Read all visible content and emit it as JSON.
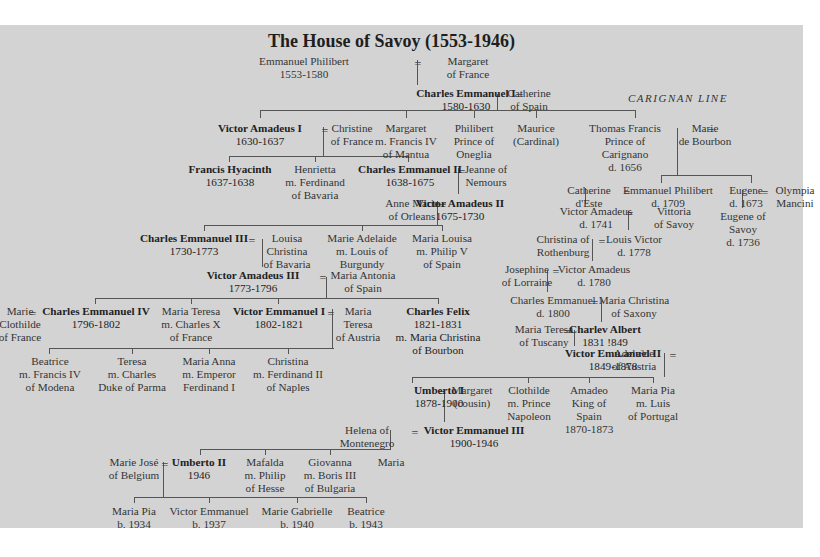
{
  "title": "The House of Savoy (1553-1946)",
  "carignan_label": "CARIGNAN LINE",
  "colors": {
    "panel": "#d3d3d3",
    "text": "#2a2a2a",
    "lines": "#555555",
    "page": "#ffffff"
  },
  "nodes": [
    {
      "id": "emmanuel-philibert",
      "x": 304,
      "y": 55,
      "bold": false,
      "lines": [
        "Emmanuel Philibert",
        "1553-1580"
      ]
    },
    {
      "id": "margaret-of-france",
      "x": 468,
      "y": 55,
      "bold": false,
      "lines": [
        "Margaret",
        "of France"
      ]
    },
    {
      "id": "charles-emmanuel-i",
      "x": 466,
      "y": 87,
      "bold": true,
      "lines": [
        "Charles Emmanuel I",
        "1580-1630"
      ],
      "sub": true
    },
    {
      "id": "catherine-of-spain",
      "x": 529,
      "y": 87,
      "bold": false,
      "lines": [
        "Catherine",
        "of Spain"
      ]
    },
    {
      "id": "victor-amadeus-i",
      "x": 260,
      "y": 122,
      "bold": true,
      "lines": [
        "Victor Amadeus I",
        "1630-1637"
      ]
    },
    {
      "id": "christine-of-france",
      "x": 352,
      "y": 122,
      "bold": false,
      "lines": [
        "Christine",
        "of France"
      ]
    },
    {
      "id": "margaret-mantua",
      "x": 406,
      "y": 122,
      "bold": false,
      "lines": [
        "Margaret",
        "m. Francis IV",
        "of Mantua"
      ]
    },
    {
      "id": "philibert-oneglia",
      "x": 474,
      "y": 122,
      "bold": false,
      "lines": [
        "Philibert",
        "Prince of",
        "Oneglia"
      ]
    },
    {
      "id": "maurice-cardinal",
      "x": 536,
      "y": 122,
      "bold": false,
      "lines": [
        "Maurice",
        "(Cardinal)"
      ]
    },
    {
      "id": "thomas-francis",
      "x": 625,
      "y": 122,
      "bold": false,
      "lines": [
        "Thomas Francis",
        "Prince of",
        "Carignano",
        "d. 1656"
      ]
    },
    {
      "id": "marie-de-bourbon",
      "x": 705,
      "y": 122,
      "bold": false,
      "lines": [
        "Marie",
        "de Bourbon"
      ]
    },
    {
      "id": "francis-hyacinth",
      "x": 230,
      "y": 163,
      "bold": true,
      "lines": [
        "Francis Hyacinth",
        "1637-1638"
      ]
    },
    {
      "id": "henrietta",
      "x": 315,
      "y": 163,
      "bold": false,
      "lines": [
        "Henrietta",
        "m. Ferdinand",
        "of Bavaria"
      ]
    },
    {
      "id": "charles-emmanuel-ii",
      "x": 410,
      "y": 163,
      "bold": true,
      "lines": [
        "Charles Emmanuel II",
        "1638-1675"
      ]
    },
    {
      "id": "jeanne-of-nemours",
      "x": 486,
      "y": 163,
      "bold": false,
      "lines": [
        "Jeanne of",
        "Nemours"
      ]
    },
    {
      "id": "catherine-d-este",
      "x": 589,
      "y": 184,
      "bold": false,
      "lines": [
        "Catherine",
        "d'Este"
      ]
    },
    {
      "id": "emmanuel-philibert-carignan",
      "x": 668,
      "y": 184,
      "bold": false,
      "lines": [
        "Emmanuel Philibert",
        "d. 1709"
      ]
    },
    {
      "id": "eugene-1673",
      "x": 746,
      "y": 184,
      "bold": false,
      "lines": [
        "Eugene",
        "d. 1673"
      ]
    },
    {
      "id": "olympia-mancini",
      "x": 795,
      "y": 184,
      "bold": false,
      "lines": [
        "Olympia",
        "Mancini"
      ]
    },
    {
      "id": "anne-marie-orleans",
      "x": 412,
      "y": 197,
      "bold": false,
      "lines": [
        "Anne Marie",
        "of Orleans"
      ]
    },
    {
      "id": "victor-amadeus-ii",
      "x": 460,
      "y": 197,
      "bold": true,
      "lines": [
        "Victor Amadeus II",
        "1675-1730"
      ],
      "left": true
    },
    {
      "id": "victor-amadeus-carignan",
      "x": 596,
      "y": 205,
      "bold": false,
      "lines": [
        "Victor Amadeus",
        "d. 1741"
      ]
    },
    {
      "id": "vittoria-of-savoy",
      "x": 674,
      "y": 205,
      "bold": false,
      "lines": [
        "Vittoria",
        "of Savoy"
      ]
    },
    {
      "id": "eugene-of-savoy",
      "x": 743,
      "y": 210,
      "bold": false,
      "lines": [
        "Eugene of",
        "Savoy",
        "d. 1736"
      ]
    },
    {
      "id": "charles-emmanuel-iii",
      "x": 194,
      "y": 232,
      "bold": true,
      "lines": [
        "Charles Emmanuel III",
        "1730-1773"
      ]
    },
    {
      "id": "louisa-christina",
      "x": 287,
      "y": 232,
      "bold": false,
      "lines": [
        "Louisa",
        "Christina",
        "of Bavaria"
      ]
    },
    {
      "id": "marie-adelaide",
      "x": 362,
      "y": 232,
      "bold": false,
      "lines": [
        "Marie Adelaide",
        "m. Louis of",
        "Burgundy"
      ]
    },
    {
      "id": "maria-louisa",
      "x": 442,
      "y": 232,
      "bold": false,
      "lines": [
        "Maria Louisa",
        "m. Philip V",
        "of Spain"
      ]
    },
    {
      "id": "christina-rothenburg",
      "x": 563,
      "y": 233,
      "bold": false,
      "lines": [
        "Christina of",
        "Rothenburg"
      ]
    },
    {
      "id": "louis-victor",
      "x": 634,
      "y": 233,
      "bold": false,
      "lines": [
        "Louis Victor",
        "d. 1778"
      ]
    },
    {
      "id": "josephine-lorraine",
      "x": 527,
      "y": 263,
      "bold": false,
      "lines": [
        "Josephine",
        "of Lorraine"
      ]
    },
    {
      "id": "victor-amadeus-1780",
      "x": 594,
      "y": 263,
      "bold": false,
      "lines": [
        "Victor Amadeus",
        "d. 1780"
      ]
    },
    {
      "id": "victor-amadeus-iii",
      "x": 253,
      "y": 269,
      "bold": true,
      "lines": [
        "Victor Amadeus III",
        "1773-1796"
      ]
    },
    {
      "id": "maria-antonia",
      "x": 363,
      "y": 269,
      "bold": false,
      "lines": [
        "Maria Antonia",
        "of Spain"
      ]
    },
    {
      "id": "charles-emmanuel-1800",
      "x": 553,
      "y": 294,
      "bold": false,
      "lines": [
        "Charles Emmanuel",
        "d. 1800"
      ]
    },
    {
      "id": "maria-christina-saxony",
      "x": 634,
      "y": 294,
      "bold": false,
      "lines": [
        "Maria Christina",
        "of Saxony"
      ]
    },
    {
      "id": "marie-clothilde",
      "x": 20,
      "y": 305,
      "bold": false,
      "lines": [
        "Marie",
        "Clothilde",
        "of France"
      ]
    },
    {
      "id": "charles-emmanuel-iv",
      "x": 96,
      "y": 305,
      "bold": true,
      "lines": [
        "Charles Emmanuel IV",
        "1796-1802"
      ]
    },
    {
      "id": "maria-teresa-charles-x",
      "x": 191,
      "y": 305,
      "bold": false,
      "lines": [
        "Maria Teresa",
        "m. Charles X",
        "of France"
      ]
    },
    {
      "id": "victor-emmanuel-i",
      "x": 279,
      "y": 305,
      "bold": true,
      "lines": [
        "Victor Emmanuel I",
        "1802-1821"
      ]
    },
    {
      "id": "maria-teresa-austria",
      "x": 358,
      "y": 305,
      "bold": false,
      "lines": [
        "Maria",
        "Teresa",
        "of Austria"
      ]
    },
    {
      "id": "charles-felix",
      "x": 438,
      "y": 305,
      "bold": true,
      "lines": [
        "Charles Felix",
        "1821-1831",
        "m. Maria Christina",
        "of Bourbon"
      ]
    },
    {
      "id": "maria-teresa-tuscany",
      "x": 544,
      "y": 323,
      "bold": false,
      "lines": [
        "Maria Teresa",
        "of Tuscany"
      ]
    },
    {
      "id": "charles-albert",
      "x": 605,
      "y": 323,
      "bold": true,
      "lines": [
        "Charlev Albert",
        "1831 !849"
      ]
    },
    {
      "id": "victor-emmanuel-ii",
      "x": 613,
      "y": 347,
      "bold": true,
      "lines": [
        "Victor Emu.anuel II",
        "1849-1878"
      ],
      "right": true
    },
    {
      "id": "adelaide-of-austria",
      "x": 634,
      "y": 347,
      "bold": false,
      "lines": [
        "Adela²de",
        "of Austria"
      ],
      "left": true
    },
    {
      "id": "beatrice-modena",
      "x": 50,
      "y": 355,
      "bold": false,
      "lines": [
        "Beatrice",
        "m. Francis IV",
        "of Modena"
      ]
    },
    {
      "id": "teresa-parma",
      "x": 132,
      "y": 355,
      "bold": false,
      "lines": [
        "Teresa",
        "m. Charles",
        "Duke of Parma"
      ]
    },
    {
      "id": "maria-anna",
      "x": 209,
      "y": 355,
      "bold": false,
      "lines": [
        "Maria Anna",
        "m. Emperor",
        "Ferdinand I"
      ]
    },
    {
      "id": "christina-naples",
      "x": 288,
      "y": 355,
      "bold": false,
      "lines": [
        "Christina",
        "m. Ferdinand II",
        "of Naples"
      ]
    },
    {
      "id": "umberto-i",
      "x": 439,
      "y": 384,
      "bold": true,
      "lines": [
        "Umberto I",
        "1878-1900"
      ]
    },
    {
      "id": "margaret-cousin",
      "x": 472,
      "y": 384,
      "bold": false,
      "lines": [
        "Margaret",
        "(cousin)"
      ],
      "left": true
    },
    {
      "id": "clothilde-napoleon",
      "x": 529,
      "y": 384,
      "bold": false,
      "lines": [
        "Clothilde",
        "m. Prince",
        "Napoleon"
      ]
    },
    {
      "id": "amadeo-spain",
      "x": 589,
      "y": 384,
      "bold": false,
      "lines": [
        "Amadeo",
        "King of",
        "Spain",
        "1870-1873"
      ]
    },
    {
      "id": "maria-pia-portugal",
      "x": 653,
      "y": 384,
      "bold": false,
      "lines": [
        "Maria Pia",
        "m. Luis",
        "of Portugal"
      ]
    },
    {
      "id": "helena-montenegro",
      "x": 367,
      "y": 424,
      "bold": false,
      "lines": [
        "Helena of",
        "Montenegro"
      ]
    },
    {
      "id": "victor-emmanuel-iii",
      "x": 474,
      "y": 424,
      "bold": true,
      "lines": [
        "Victor Emmanuel III",
        "1900-1946"
      ],
      "left": true
    },
    {
      "id": "marie-jose",
      "x": 134,
      "y": 456,
      "bold": false,
      "lines": [
        "Marie José",
        "of Belgium"
      ]
    },
    {
      "id": "umberto-ii",
      "x": 199,
      "y": 456,
      "bold": true,
      "lines": [
        "Umberto II",
        "1946"
      ]
    },
    {
      "id": "mafalda",
      "x": 265,
      "y": 456,
      "bold": false,
      "lines": [
        "Mafalda",
        "m. Philip",
        "of Hesse"
      ]
    },
    {
      "id": "giovanna",
      "x": 330,
      "y": 456,
      "bold": false,
      "lines": [
        "Giovanna",
        "m. Boris III",
        "of Bulgaria"
      ]
    },
    {
      "id": "maria",
      "x": 391,
      "y": 456,
      "bold": false,
      "lines": [
        "Maria"
      ]
    },
    {
      "id": "maria-pia-1934",
      "x": 134,
      "y": 505,
      "bold": false,
      "lines": [
        "Maria Pia",
        "b. 1934"
      ]
    },
    {
      "id": "victor-emmanuel-1937",
      "x": 209,
      "y": 505,
      "bold": false,
      "lines": [
        "Victor Emmanuel",
        "b. 1937"
      ]
    },
    {
      "id": "marie-gabrielle",
      "x": 297,
      "y": 505,
      "bold": false,
      "lines": [
        "Marie Gabrielle",
        "b. 1940"
      ]
    },
    {
      "id": "beatrice-1943",
      "x": 366,
      "y": 505,
      "bold": false,
      "lines": [
        "Beatrice",
        "b. 1943"
      ]
    }
  ],
  "marriage_signs": [
    {
      "x": 418,
      "y": 58
    },
    {
      "x": 520,
      "y": 90
    },
    {
      "x": 325,
      "y": 125
    },
    {
      "x": 711,
      "y": 125
    },
    {
      "x": 462,
      "y": 166
    },
    {
      "x": 443,
      "y": 200
    },
    {
      "x": 627,
      "y": 187
    },
    {
      "x": 765,
      "y": 187
    },
    {
      "x": 630,
      "y": 208
    },
    {
      "x": 602,
      "y": 236
    },
    {
      "x": 556,
      "y": 266
    },
    {
      "x": 252,
      "y": 235
    },
    {
      "x": 323,
      "y": 272
    },
    {
      "x": 595,
      "y": 297
    },
    {
      "x": 33,
      "y": 308
    },
    {
      "x": 331,
      "y": 308
    },
    {
      "x": 567,
      "y": 326
    },
    {
      "x": 673,
      "y": 350
    },
    {
      "x": 442,
      "y": 387
    },
    {
      "x": 415,
      "y": 427
    },
    {
      "x": 165,
      "y": 459
    }
  ],
  "hlines": [
    {
      "x": 260,
      "y": 110,
      "w": 375
    },
    {
      "x": 229,
      "y": 156,
      "w": 179
    },
    {
      "x": 204,
      "y": 225,
      "w": 238
    },
    {
      "x": 95,
      "y": 298,
      "w": 343
    },
    {
      "x": 49,
      "y": 348,
      "w": 285
    },
    {
      "x": 412,
      "y": 377,
      "w": 241
    },
    {
      "x": 661,
      "y": 175,
      "w": 90
    },
    {
      "x": 200,
      "y": 449,
      "w": 191
    },
    {
      "x": 134,
      "y": 497,
      "w": 233
    }
  ],
  "vlines": [
    {
      "x": 417,
      "y": 60,
      "h": 25
    },
    {
      "x": 497,
      "y": 94,
      "h": 16
    },
    {
      "x": 260,
      "y": 110,
      "h": 8
    },
    {
      "x": 406,
      "y": 110,
      "h": 8
    },
    {
      "x": 474,
      "y": 110,
      "h": 8
    },
    {
      "x": 536,
      "y": 110,
      "h": 8
    },
    {
      "x": 635,
      "y": 110,
      "h": 8
    },
    {
      "x": 323,
      "y": 127,
      "h": 29
    },
    {
      "x": 229,
      "y": 156,
      "h": 6
    },
    {
      "x": 315,
      "y": 156,
      "h": 6
    },
    {
      "x": 408,
      "y": 156,
      "h": 6
    },
    {
      "x": 458,
      "y": 168,
      "h": 26
    },
    {
      "x": 437,
      "y": 201,
      "h": 24
    },
    {
      "x": 204,
      "y": 225,
      "h": 6
    },
    {
      "x": 362,
      "y": 225,
      "h": 6
    },
    {
      "x": 442,
      "y": 225,
      "h": 6
    },
    {
      "x": 262,
      "y": 239,
      "h": 28
    },
    {
      "x": 326,
      "y": 277,
      "h": 21
    },
    {
      "x": 95,
      "y": 298,
      "h": 6
    },
    {
      "x": 191,
      "y": 298,
      "h": 6
    },
    {
      "x": 278,
      "y": 298,
      "h": 6
    },
    {
      "x": 438,
      "y": 298,
      "h": 6
    },
    {
      "x": 332,
      "y": 309,
      "h": 39
    },
    {
      "x": 49,
      "y": 348,
      "h": 6
    },
    {
      "x": 132,
      "y": 348,
      "h": 6
    },
    {
      "x": 209,
      "y": 348,
      "h": 6
    },
    {
      "x": 288,
      "y": 348,
      "h": 6
    },
    {
      "x": 677,
      "y": 128,
      "h": 47
    },
    {
      "x": 661,
      "y": 175,
      "h": 8
    },
    {
      "x": 751,
      "y": 175,
      "h": 8
    },
    {
      "x": 585,
      "y": 188,
      "h": 16
    },
    {
      "x": 742,
      "y": 190,
      "h": 18
    },
    {
      "x": 628,
      "y": 211,
      "h": 19
    },
    {
      "x": 592,
      "y": 239,
      "h": 22
    },
    {
      "x": 547,
      "y": 270,
      "h": 22
    },
    {
      "x": 601,
      "y": 300,
      "h": 22
    },
    {
      "x": 574,
      "y": 330,
      "h": 16
    },
    {
      "x": 664,
      "y": 353,
      "h": 24
    },
    {
      "x": 412,
      "y": 377,
      "h": 6
    },
    {
      "x": 528,
      "y": 377,
      "h": 6
    },
    {
      "x": 589,
      "y": 377,
      "h": 6
    },
    {
      "x": 653,
      "y": 377,
      "h": 6
    },
    {
      "x": 444,
      "y": 391,
      "h": 31
    },
    {
      "x": 390,
      "y": 430,
      "h": 19
    },
    {
      "x": 200,
      "y": 449,
      "h": 6
    },
    {
      "x": 265,
      "y": 449,
      "h": 6
    },
    {
      "x": 330,
      "y": 449,
      "h": 6
    },
    {
      "x": 163,
      "y": 462,
      "h": 35
    },
    {
      "x": 134,
      "y": 497,
      "h": 6
    },
    {
      "x": 209,
      "y": 497,
      "h": 6
    },
    {
      "x": 297,
      "y": 497,
      "h": 6
    },
    {
      "x": 366,
      "y": 497,
      "h": 6
    }
  ]
}
